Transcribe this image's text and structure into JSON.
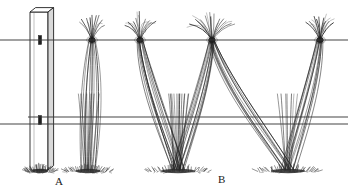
{
  "figure": {
    "labels": [
      {
        "id": "label-a",
        "text": "A",
        "x": 55,
        "y": 176
      },
      {
        "id": "label-b",
        "text": "B",
        "x": 218,
        "y": 174
      }
    ],
    "colors": {
      "ink": "#1f1f1f",
      "wire": "#3a3a3a",
      "post_face": "#ffffff",
      "post_shade": "#d9d9d9",
      "ground": "#2a2a2a",
      "background": "#ffffff"
    },
    "canvas": {
      "width": 348,
      "height": 196
    }
  },
  "chart_data": {
    "type": "diagram",
    "xlabel": "",
    "ylabel": "",
    "grid": false,
    "legend": "none",
    "post": {
      "name": "end-post",
      "x_left": 30,
      "x_right": 48,
      "y_top": 12,
      "y_bottom": 170,
      "top_cap_depth": 8,
      "staples": [
        {
          "wire": "top-wire",
          "x": 40,
          "y": 40
        },
        {
          "wire": "lower-wire-1",
          "x": 40,
          "y": 120
        }
      ]
    },
    "wires": [
      {
        "name": "top-wire",
        "y": 40,
        "x_start": 0,
        "x_end": 348
      },
      {
        "name": "lower-wire-1",
        "y": 117,
        "x_start": 28,
        "x_end": 348
      },
      {
        "name": "lower-wire-2",
        "y": 124,
        "x_start": 0,
        "x_end": 348
      }
    ],
    "ground_line_y": 170,
    "vines": [
      {
        "name": "vine-1",
        "label": "A",
        "head_x": 92,
        "head_y": 40,
        "trunk_base_x": 88,
        "trunk_base_y": 170,
        "style": "narrow-curtain",
        "cane_count": 11,
        "shoot_count": 9,
        "spread": 22
      },
      {
        "name": "vine-2",
        "label": "A",
        "head_x": 140,
        "head_y": 40,
        "trunk_base_x": 178,
        "trunk_base_y": 170,
        "style": "wide-v",
        "cane_count": 11,
        "shoot_count": 9,
        "spread": 26
      },
      {
        "name": "vine-3",
        "label": "B",
        "head_x": 212,
        "head_y": 40,
        "trunk_base_x": 178,
        "trunk_base_y": 170,
        "style": "wide-v",
        "cane_count": 13,
        "shoot_count": 13,
        "spread": 34
      },
      {
        "name": "vine-4",
        "label": "B",
        "head_x": 320,
        "head_y": 40,
        "trunk_base_x": 288,
        "trunk_base_y": 170,
        "style": "wide-v",
        "cane_count": 11,
        "shoot_count": 9,
        "spread": 22
      }
    ],
    "ground_tufts": [
      {
        "x": 40,
        "y": 170,
        "width": 30
      },
      {
        "x": 88,
        "y": 170,
        "width": 46
      },
      {
        "x": 178,
        "y": 170,
        "width": 62
      },
      {
        "x": 288,
        "y": 170,
        "width": 62
      }
    ],
    "cane_sweeps": [
      {
        "from_head_x": 92,
        "to_base_x": 88,
        "direction": "down-straight"
      },
      {
        "from_head_x": 140,
        "to_base_x": 178,
        "direction": "down-right"
      },
      {
        "from_head_x": 212,
        "to_base_x": 178,
        "direction": "down-left"
      },
      {
        "from_head_x": 212,
        "to_base_x": 288,
        "direction": "down-right"
      },
      {
        "from_head_x": 320,
        "to_base_x": 288,
        "direction": "down-left"
      }
    ]
  }
}
